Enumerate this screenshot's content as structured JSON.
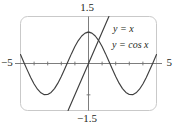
{
  "figure": {
    "title": "",
    "background_color": "#ffffff",
    "frame_color": "#c9c9c9",
    "curve_color": "#3f3f3f",
    "axis_color": "#6e6e6e",
    "text_color": "#231f20"
  },
  "labels": {
    "y_max": "1.5",
    "y_min": "−1.5",
    "x_min": "−5",
    "x_max": "5",
    "line_curve": "y = x",
    "cos_curve": "y = cos x"
  },
  "chart_data": {
    "type": "line",
    "title": "",
    "xlabel": "",
    "ylabel": "",
    "xlim": [
      -5,
      5
    ],
    "ylim": [
      -1.5,
      1.5
    ],
    "grid": false,
    "legend_position": "inside-right",
    "x_ticks": [
      -5,
      -4,
      -3,
      -2,
      -1,
      0,
      1,
      2,
      3,
      4,
      5
    ],
    "y_ticks": [
      -1,
      0,
      1
    ],
    "x_tick_labels": [
      "−5",
      "",
      "",
      "",
      "",
      "",
      "",
      "",
      "",
      "",
      "5"
    ],
    "y_tick_labels": [
      "",
      "",
      ""
    ],
    "annotations": [
      {
        "text": "1.5",
        "position": "top-center",
        "meaning": "y-axis maximum of viewing window"
      },
      {
        "text": "−1.5",
        "position": "bottom-center",
        "meaning": "y-axis minimum of viewing window"
      },
      {
        "text": "−5",
        "position": "left",
        "meaning": "x-axis minimum of viewing window"
      },
      {
        "text": "5",
        "position": "right",
        "meaning": "x-axis maximum of viewing window"
      },
      {
        "text": "y = x",
        "position": "upper-right",
        "meaning": "label for the straight line"
      },
      {
        "text": "y = cos x",
        "position": "right",
        "meaning": "label for the cosine curve"
      }
    ],
    "series": [
      {
        "name": "y = cos x",
        "type": "line",
        "color": "#3f3f3f",
        "x": [
          -5,
          -4.75,
          -4.5,
          -4.25,
          -4,
          -3.75,
          -3.5,
          -3.25,
          -3,
          -2.75,
          -2.5,
          -2.25,
          -2,
          -1.75,
          -1.5,
          -1.25,
          -1,
          -0.75,
          -0.5,
          -0.25,
          0,
          0.25,
          0.5,
          0.75,
          1,
          1.25,
          1.5,
          1.75,
          2,
          2.25,
          2.5,
          2.75,
          3,
          3.25,
          3.5,
          3.75,
          4,
          4.25,
          4.5,
          4.75,
          5
        ],
        "y": [
          0.284,
          0.035,
          -0.211,
          -0.447,
          -0.654,
          -0.821,
          -0.936,
          -0.994,
          -0.99,
          -0.924,
          -0.801,
          -0.628,
          -0.416,
          -0.178,
          0.071,
          0.315,
          0.54,
          0.732,
          0.878,
          0.969,
          1,
          0.969,
          0.878,
          0.732,
          0.54,
          0.315,
          0.071,
          -0.178,
          -0.416,
          -0.628,
          -0.801,
          -0.924,
          -0.99,
          -0.994,
          -0.936,
          -0.821,
          -0.654,
          -0.447,
          -0.211,
          0.035,
          0.284
        ]
      },
      {
        "name": "y = x",
        "type": "line",
        "color": "#3f3f3f",
        "x": [
          -1.5,
          1.5
        ],
        "y": [
          -1.5,
          1.5
        ]
      }
    ],
    "intersection": {
      "x": 0.739,
      "y": 0.739,
      "label": ""
    }
  }
}
